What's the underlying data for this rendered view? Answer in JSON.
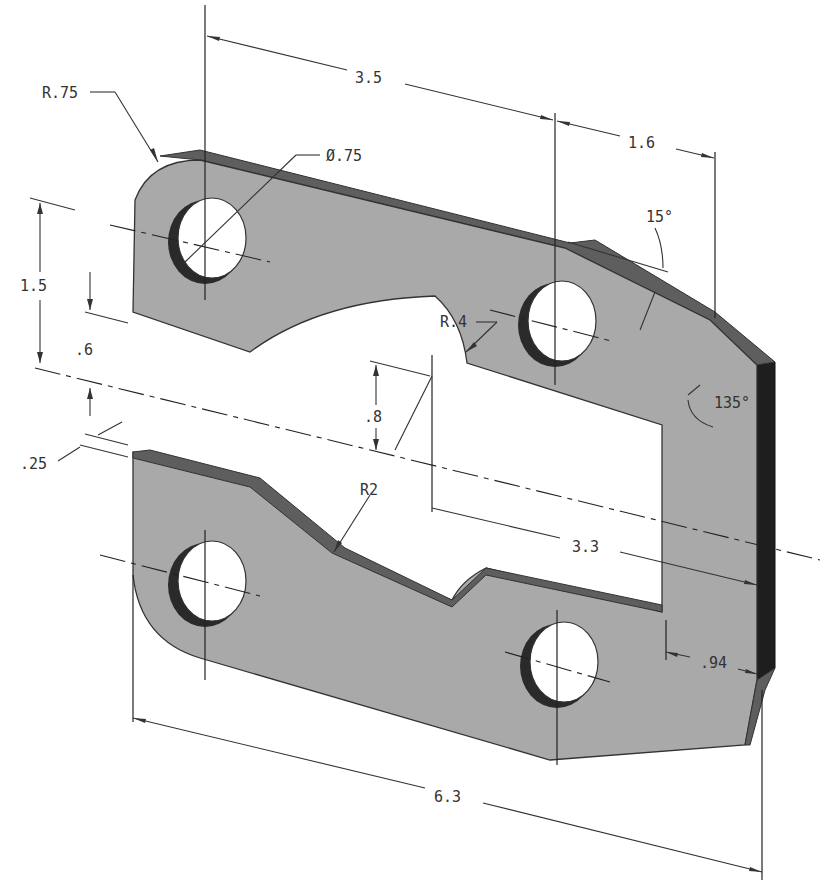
{
  "drawing": {
    "type": "isometric mechanical part drawing",
    "colors": {
      "face": "#a9a9a9",
      "edge": "#5e5e5e",
      "side": "#1e1e1e",
      "background": "#ffffff",
      "lines": "#333333"
    },
    "dimensions": {
      "corner_radius": "R.75",
      "hole_diameter": "Ø.75",
      "hole_spacing_top": "3.5",
      "right_offset": "1.6",
      "chamfer_angle": "15°",
      "hole_vertical": "1.5",
      "slot_gap": ".6",
      "slot_offset": ".25",
      "notch_radius": "R.4",
      "notch_height": ".8",
      "arc_radius": "R2",
      "corner_angle": "135°",
      "slot_length": "3.3",
      "slot_end_margin": ".94",
      "overall_length": "6.3"
    }
  }
}
